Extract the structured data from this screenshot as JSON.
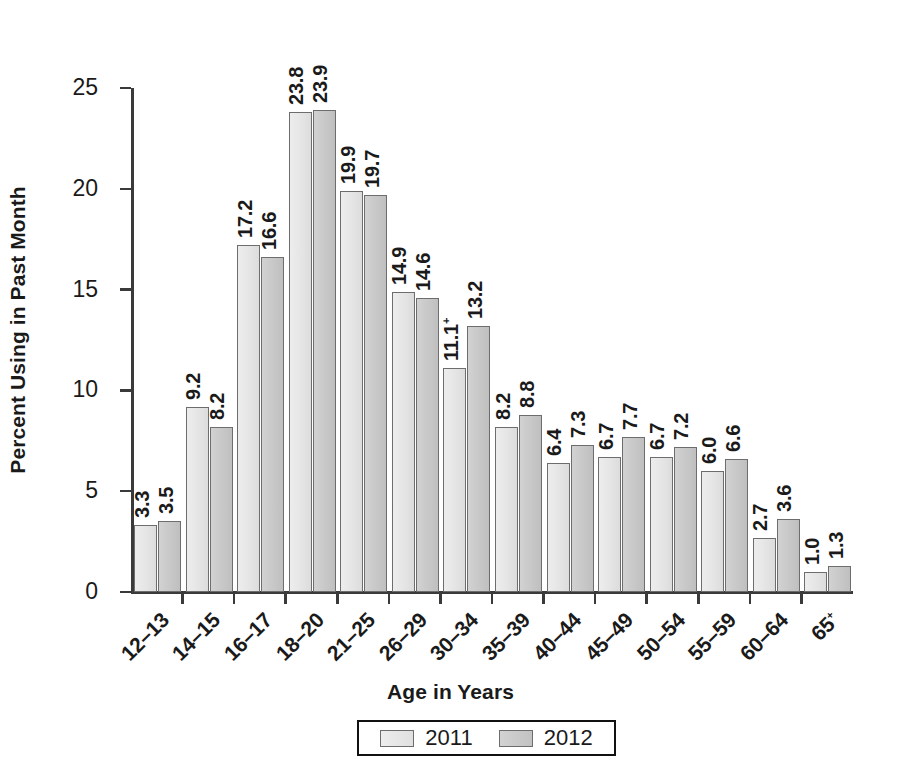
{
  "chart_data": {
    "type": "bar",
    "title": "",
    "xlabel": "Age in Years",
    "ylabel": "Percent Using in Past Month",
    "ylim": [
      0,
      25
    ],
    "yticks": [
      0,
      5,
      10,
      15,
      20,
      25
    ],
    "grid": false,
    "legend_position": "bottom-center",
    "categories": [
      "12–13",
      "14–15",
      "16–17",
      "18–20",
      "21–25",
      "26–29",
      "30–34",
      "35–39",
      "40–44",
      "45–49",
      "50–54",
      "55–59",
      "60–64",
      "65+"
    ],
    "series": [
      {
        "name": "2011",
        "color": "#e6e6e6",
        "values": [
          3.3,
          9.2,
          17.2,
          23.8,
          19.9,
          14.9,
          11.1,
          8.2,
          6.4,
          6.7,
          6.7,
          6.0,
          2.7,
          1.0
        ],
        "labels": [
          "3.3",
          "9.2",
          "17.2",
          "23.8",
          "19.9",
          "14.9",
          "11.1",
          "8.2",
          "6.4",
          "6.7",
          "6.7",
          "6.0",
          "2.7",
          "1.0"
        ],
        "label_marks": [
          "",
          "",
          "",
          "",
          "",
          "",
          "+",
          "",
          "",
          "",
          "",
          "",
          "",
          ""
        ]
      },
      {
        "name": "2012",
        "color": "#c8c8c8",
        "values": [
          3.5,
          8.2,
          16.6,
          23.9,
          19.7,
          14.6,
          13.2,
          8.8,
          7.3,
          7.7,
          7.2,
          6.6,
          3.6,
          1.3
        ],
        "labels": [
          "3.5",
          "8.2",
          "16.6",
          "23.9",
          "19.7",
          "14.6",
          "13.2",
          "8.8",
          "7.3",
          "7.7",
          "7.2",
          "6.6",
          "3.6",
          "1.3"
        ],
        "label_marks": [
          "",
          "",
          "",
          "",
          "",
          "",
          "",
          "",
          "",
          "",
          "",
          "",
          "",
          ""
        ]
      }
    ]
  },
  "axes": {
    "y_title": "Percent Using in Past Month",
    "x_title": "Age in Years",
    "y_tick_labels": [
      "0",
      "5",
      "10",
      "15",
      "20",
      "25"
    ]
  },
  "legend": {
    "items": [
      {
        "label": "2011",
        "swatch": "y2011"
      },
      {
        "label": "2012",
        "swatch": "y2012"
      }
    ]
  }
}
